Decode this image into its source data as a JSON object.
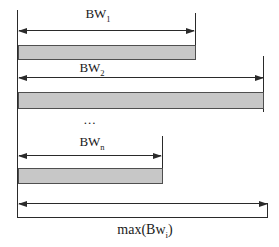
{
  "diagram": {
    "ellipsis": "...",
    "rows": [
      {
        "id": "bw1",
        "label_base": "BW",
        "label_sub": "1"
      },
      {
        "id": "bw2",
        "label_base": "BW",
        "label_sub": "2"
      },
      {
        "id": "bwn",
        "label_base": "BW",
        "label_sub": "n"
      }
    ],
    "max_label": {
      "base": "max(Bw",
      "sub": "i",
      "close": ")"
    }
  },
  "colors": {
    "line": "#2a2a2a",
    "bar_fill": "#c7c7c7",
    "bar_border": "#4f4f4f",
    "background": "#ffffff"
  }
}
